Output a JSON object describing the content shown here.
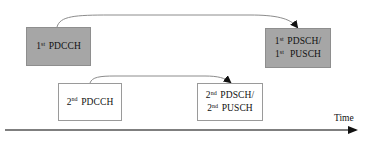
{
  "diagram": {
    "type": "timeline-scheduling",
    "colors": {
      "filled_box": "#a6a6a6",
      "outline_box_border": "#9a9a9a",
      "connector": "#8c8c8c",
      "axis": "#555555",
      "arrowhead": "#111111"
    },
    "boxes": [
      {
        "id": "first-pdcch",
        "style": "filled",
        "lines": [
          {
            "ordinal": "1",
            "suffix": "st",
            "text": "PDCCH"
          }
        ]
      },
      {
        "id": "first-pdsch-pusch",
        "style": "filled",
        "lines": [
          {
            "ordinal": "1",
            "suffix": "st",
            "text": "PDSCH/"
          },
          {
            "ordinal": "1",
            "suffix": "st",
            "text": "PUSCH"
          }
        ]
      },
      {
        "id": "second-pdcch",
        "style": "outline",
        "lines": [
          {
            "ordinal": "2",
            "suffix": "nd",
            "text": "PDCCH"
          }
        ]
      },
      {
        "id": "second-pdsch-pusch",
        "style": "outline",
        "lines": [
          {
            "ordinal": "2",
            "suffix": "nd",
            "text": "PDSCH/"
          },
          {
            "ordinal": "2",
            "suffix": "nd",
            "text": "PUSCH"
          }
        ]
      }
    ],
    "connectors": [
      {
        "from": "first-pdcch",
        "to": "first-pdsch-pusch"
      },
      {
        "from": "second-pdcch",
        "to": "second-pdsch-pusch"
      }
    ],
    "axis": {
      "label": "Time",
      "direction": "left-to-right"
    }
  }
}
